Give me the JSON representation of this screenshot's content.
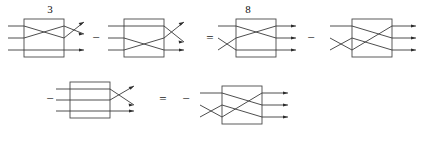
{
  "figure": {
    "kind": "braid-tangle-equation",
    "background_color": "#ffffff",
    "stroke_color": "#3a3a3a",
    "box_color": "#4a4a4a",
    "text_color": "#111111",
    "rows": [
      {
        "id": "row-1",
        "elements": [
          {
            "type": "label",
            "text": "3",
            "name": "coefficient-label-3"
          },
          {
            "type": "diagram",
            "name": "tangle-diagram-1"
          },
          {
            "type": "operator",
            "text": "−",
            "name": "operator-minus-1"
          },
          {
            "type": "diagram",
            "name": "tangle-diagram-2"
          },
          {
            "type": "operator",
            "text": "=",
            "name": "operator-equals-1"
          },
          {
            "type": "label",
            "text": "8",
            "name": "coefficient-label-8"
          },
          {
            "type": "diagram",
            "name": "tangle-diagram-3"
          },
          {
            "type": "operator",
            "text": "−",
            "name": "operator-minus-2"
          },
          {
            "type": "diagram",
            "name": "tangle-diagram-4"
          }
        ]
      },
      {
        "id": "row-2",
        "elements": [
          {
            "type": "operator",
            "text": "−",
            "name": "operator-minus-3"
          },
          {
            "type": "diagram",
            "name": "tangle-diagram-5"
          },
          {
            "type": "operator",
            "text": "=",
            "name": "operator-equals-2"
          },
          {
            "type": "operator",
            "text": "−",
            "name": "operator-minus-4"
          },
          {
            "type": "diagram",
            "name": "tangle-diagram-6"
          }
        ]
      }
    ],
    "operators": {
      "minus_1": "−",
      "equals_1": "=",
      "minus_2": "−",
      "minus_3": "−",
      "equals_2": "=",
      "minus_4": "−"
    },
    "labels": {
      "coefficient_left": "3",
      "coefficient_right": "8"
    },
    "strand_count": 3,
    "diagrams": [
      {
        "id": "tangle-diagram-1",
        "name": "tangle-diagram-1",
        "strands": 3,
        "crossings_inside_box": 1,
        "crossings_right_of_box": 1,
        "arrows": 3,
        "label_above": "3"
      },
      {
        "id": "tangle-diagram-2",
        "name": "tangle-diagram-2",
        "strands": 3,
        "crossings_inside_box": 1,
        "crossings_right_of_box": 1,
        "arrows": 3,
        "label_above": ""
      },
      {
        "id": "tangle-diagram-3",
        "name": "tangle-diagram-3",
        "strands": 3,
        "crossings_left_of_box": 1,
        "crossings_inside_box": 1,
        "arrows": 3,
        "label_above": "8"
      },
      {
        "id": "tangle-diagram-4",
        "name": "tangle-diagram-4",
        "strands": 3,
        "crossings_left_of_box": 1,
        "crossings_inside_box": 1,
        "arrows": 3,
        "label_above": ""
      },
      {
        "id": "tangle-diagram-5",
        "name": "tangle-diagram-5",
        "strands": 3,
        "crossings_inside_box": 0,
        "crossings_right_of_box": 1,
        "arrows": 3,
        "label_above": ""
      },
      {
        "id": "tangle-diagram-6",
        "name": "tangle-diagram-6",
        "strands": 3,
        "crossings_left_of_box": 1,
        "crossings_inside_box": 1,
        "arrows": 3,
        "label_above": ""
      }
    ]
  }
}
